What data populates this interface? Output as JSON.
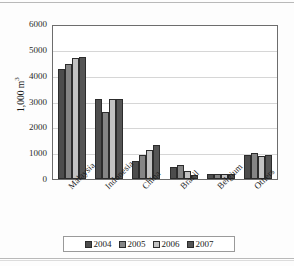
{
  "chart_data": {
    "type": "bar",
    "title": "",
    "subtitle": "",
    "xlabel": "",
    "ylabel": "1,000 m",
    "ylabel_superscript": "3",
    "categories": [
      "Malaysia",
      "Indonesia",
      "China",
      "Brazil",
      "Belgium",
      "Others"
    ],
    "series": [
      {
        "name": "2004",
        "color": "#4d4d4d",
        "values": [
          4330,
          3130,
          720,
          480,
          210,
          940
        ]
      },
      {
        "name": "2005",
        "color": "#858585",
        "values": [
          4520,
          2620,
          960,
          550,
          200,
          1010
        ]
      },
      {
        "name": "2006",
        "color": "#c2c2c2",
        "values": [
          4760,
          3130,
          1130,
          320,
          200,
          890
        ]
      },
      {
        "name": "2007",
        "color": "#555555",
        "values": [
          4770,
          3120,
          1320,
          170,
          200,
          960
        ]
      }
    ],
    "ylim": [
      0,
      6000
    ],
    "yticks": [
      0,
      1000,
      2000,
      3000,
      4000,
      5000,
      6000
    ],
    "ytick_labels": [
      "0",
      "1000",
      "2000",
      "3000",
      "4000",
      "5000",
      "6000"
    ],
    "grid": "horizontal",
    "legend_position": "bottom",
    "legend_entries": [
      "2004",
      "2005",
      "2006",
      "2007"
    ]
  }
}
